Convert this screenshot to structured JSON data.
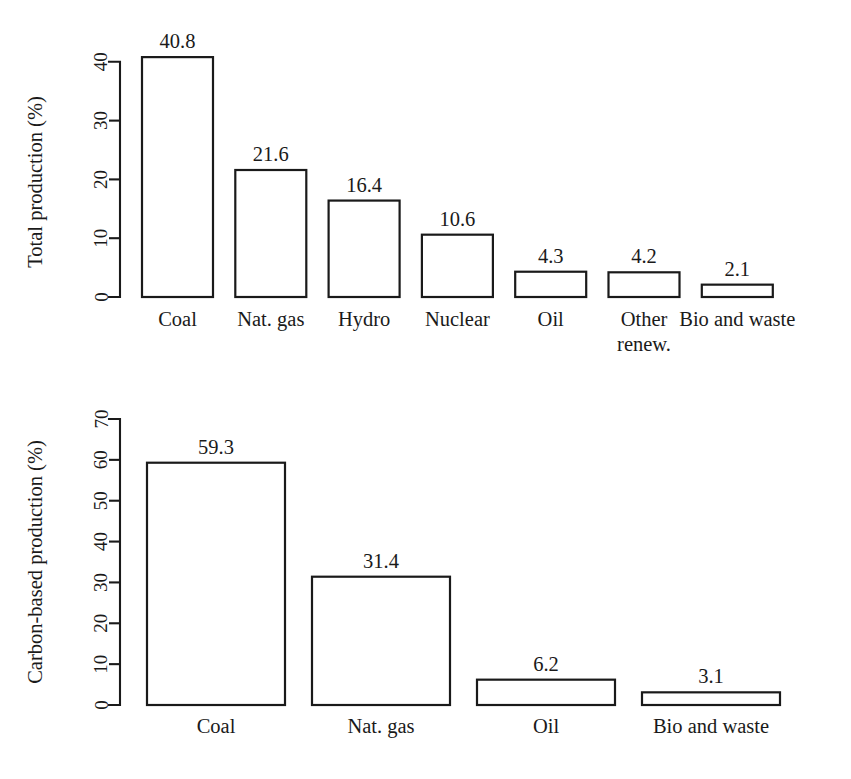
{
  "figure": {
    "width": 851,
    "height": 779,
    "background": "#ffffff",
    "ink_color": "#1a1a1a"
  },
  "chart_data": [
    {
      "type": "bar",
      "id": "total-production",
      "title": "",
      "xlabel": "",
      "ylabel": "Total production (%)",
      "categories": [
        "Coal",
        "Nat. gas",
        "Hydro",
        "Nuclear",
        "Oil",
        "Other renew.",
        "Bio and waste"
      ],
      "category_lines": [
        [
          "Coal"
        ],
        [
          "Nat. gas"
        ],
        [
          "Hydro"
        ],
        [
          "Nuclear"
        ],
        [
          "Oil"
        ],
        [
          "Other",
          "renew."
        ],
        [
          "Bio and waste"
        ]
      ],
      "values": [
        40.8,
        21.6,
        16.4,
        10.6,
        4.3,
        4.2,
        2.1
      ],
      "value_labels": [
        "40.8",
        "21.6",
        "16.4",
        "10.6",
        "4.3",
        "4.2",
        "2.1"
      ],
      "ylim": [
        0,
        41.5
      ],
      "yticks": [
        0,
        10,
        20,
        30,
        40
      ],
      "ytick_labels": [
        "0",
        "10",
        "20",
        "30",
        "40"
      ],
      "grid": false,
      "legend": "none",
      "bar_fill": "#ffffff",
      "bar_stroke": "#1a1a1a"
    },
    {
      "type": "bar",
      "id": "carbon-based-production",
      "title": "",
      "xlabel": "",
      "ylabel": "Carbon-based production (%)",
      "categories": [
        "Coal",
        "Nat. gas",
        "Oil",
        "Bio and waste"
      ],
      "category_lines": [
        [
          "Coal"
        ],
        [
          "Nat. gas"
        ],
        [
          "Oil"
        ],
        [
          "Bio and waste"
        ]
      ],
      "values": [
        59.3,
        31.4,
        6.2,
        3.1
      ],
      "value_labels": [
        "59.3",
        "31.4",
        "6.2",
        "3.1"
      ],
      "ylim": [
        0,
        70
      ],
      "yticks": [
        0,
        10,
        20,
        30,
        40,
        50,
        60,
        70
      ],
      "ytick_labels": [
        "0",
        "10",
        "20",
        "30",
        "40",
        "50",
        "60",
        "70"
      ],
      "grid": false,
      "legend": "none",
      "bar_fill": "#ffffff",
      "bar_stroke": "#1a1a1a"
    }
  ]
}
